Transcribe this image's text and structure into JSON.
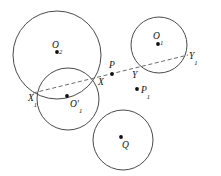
{
  "figure": {
    "width": 221,
    "height": 176,
    "background_color": "#ffffff",
    "stroke_color": "#4a4a4a",
    "dash_color": "#6b6b6b",
    "point_color": "#111111"
  },
  "circles": [
    {
      "id": "O2",
      "label": "O",
      "sub": "2",
      "cx": 57,
      "cy": 55,
      "r": 44
    },
    {
      "id": "O1prime",
      "label": "O'",
      "sub": "1",
      "cx": 68,
      "cy": 99,
      "r": 31
    },
    {
      "id": "O1",
      "label": "O",
      "sub": "1",
      "cx": 159,
      "cy": 45,
      "r": 28
    },
    {
      "id": "Q",
      "label": "Q",
      "sub": "",
      "cx": 123,
      "cy": 140,
      "r": 30
    }
  ],
  "secant": {
    "x1": 33,
    "y1": 93,
    "x2": 188,
    "y2": 55,
    "style": "dashed"
  },
  "points": [
    {
      "id": "O2",
      "label": "O",
      "sub": "2",
      "x": 57,
      "y": 52,
      "lx": 52,
      "ly": 48,
      "dot": true
    },
    {
      "id": "O1prime",
      "label": "O'",
      "sub": "1",
      "x": 67,
      "y": 96,
      "lx": 70,
      "ly": 107,
      "dot": true
    },
    {
      "id": "O1",
      "label": "O",
      "sub": "1",
      "x": 158,
      "y": 44,
      "lx": 153,
      "ly": 39,
      "dot": true
    },
    {
      "id": "Q",
      "label": "Q",
      "sub": "",
      "x": 121,
      "y": 137,
      "lx": 122,
      "ly": 148,
      "dot": true
    },
    {
      "id": "P",
      "label": "P",
      "sub": "",
      "x": 112,
      "y": 74,
      "lx": 109,
      "ly": 68,
      "dot": true
    },
    {
      "id": "P1",
      "label": "P",
      "sub": "1",
      "x": 137,
      "y": 89,
      "lx": 141,
      "ly": 93,
      "dot": true
    },
    {
      "id": "X",
      "label": "X",
      "sub": "",
      "x": 96,
      "y": 78,
      "lx": 98,
      "ly": 85,
      "dot": false
    },
    {
      "id": "X1",
      "label": "X",
      "sub": "1",
      "x": 34,
      "y": 92,
      "lx": 28,
      "ly": 101,
      "dot": false
    },
    {
      "id": "Y",
      "label": "Y",
      "sub": "",
      "x": 135,
      "y": 70,
      "lx": 132,
      "ly": 78,
      "dot": false
    },
    {
      "id": "Y1",
      "label": "Y",
      "sub": "1",
      "x": 186,
      "y": 56,
      "lx": 189,
      "ly": 59,
      "dot": false
    }
  ]
}
